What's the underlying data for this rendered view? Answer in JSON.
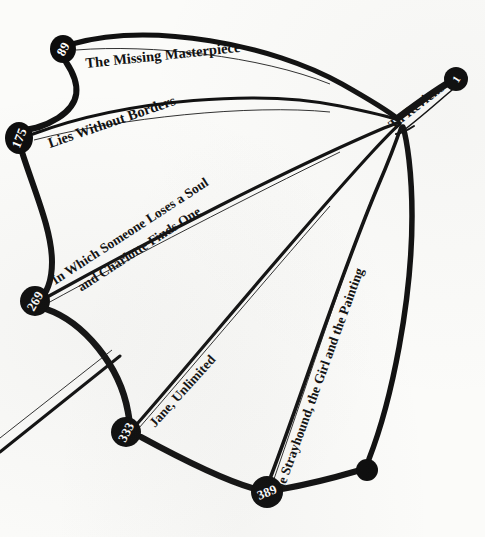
{
  "figure": {
    "type": "node-link-diagram",
    "medium": "printed-book-page-scan",
    "background_color": "#fbfbf9",
    "ink_color": "#111111",
    "node_fill_color": "#0d0d0d",
    "node_text_color": "#ffffff"
  },
  "nodes": [
    {
      "id": "n89",
      "label": "89",
      "x": 63,
      "y": 49,
      "rx": 13,
      "ry": 14,
      "rotation": -62,
      "kind": "numbered-page-node"
    },
    {
      "id": "n175",
      "label": "175",
      "x": 19,
      "y": 138,
      "rx": 14,
      "ry": 16,
      "rotation": -68,
      "kind": "numbered-page-node"
    },
    {
      "id": "n269",
      "label": "269",
      "x": 35,
      "y": 301,
      "rx": 15,
      "ry": 15,
      "rotation": -60,
      "kind": "numbered-page-node"
    },
    {
      "id": "n333",
      "label": "333",
      "x": 126,
      "y": 432,
      "rx": 15,
      "ry": 15,
      "rotation": -62,
      "kind": "numbered-page-node"
    },
    {
      "id": "n389",
      "label": "389",
      "x": 267,
      "y": 492,
      "rx": 16,
      "ry": 16,
      "rotation": -22,
      "kind": "numbered-page-node"
    },
    {
      "id": "n1",
      "label": "1",
      "x": 456,
      "y": 79,
      "rx": 12,
      "ry": 12,
      "rotation": -58,
      "kind": "numbered-page-node"
    },
    {
      "id": "ndot",
      "label": "",
      "x": 367,
      "y": 470,
      "rx": 11,
      "ry": 11,
      "rotation": 0,
      "kind": "plain-node"
    }
  ],
  "hub": {
    "id": "hub",
    "x": 401,
    "y": 122,
    "label": "Tu Reviens"
  },
  "edges": [
    {
      "id": "e1",
      "from": "n89",
      "to": "hub",
      "label": "The Missing Masterpiece"
    },
    {
      "id": "e2",
      "from": "n175",
      "to": "hub",
      "label": "Lies Without Borders"
    },
    {
      "id": "e3",
      "from": "n269",
      "to": "hub",
      "label": "In Which Someone Loses a Soul and Charlotte Finds One"
    },
    {
      "id": "e4",
      "from": "n333",
      "to": "hub",
      "label": "Jane, Unlimited"
    },
    {
      "id": "e5",
      "from": "n389",
      "to": "hub",
      "label": "The Strayhound, the Girl and the Painting"
    },
    {
      "id": "e6",
      "from": "hub",
      "to": "n1",
      "label": "Tu Reviens"
    },
    {
      "id": "e7",
      "from": "n89",
      "to": "n175",
      "label": ""
    },
    {
      "id": "e8",
      "from": "n175",
      "to": "n269",
      "label": ""
    },
    {
      "id": "e9",
      "from": "n269",
      "to": "n333",
      "label": ""
    },
    {
      "id": "e10",
      "from": "n333",
      "to": "n389",
      "label": ""
    },
    {
      "id": "e11",
      "from": "n389",
      "to": "ndot",
      "label": ""
    },
    {
      "id": "e12",
      "from": "ndot",
      "to": "hub",
      "label": ""
    }
  ],
  "labels": {
    "missing_masterpiece": "The Missing Masterpiece",
    "lies_without_borders": "Lies Without Borders",
    "someone_loses_line1": "In Which Someone Loses a Soul",
    "someone_loses_line2": "and Charlotte Finds One",
    "jane_unlimited": "Jane, Unlimited",
    "strayhound": "The Strayhound, the Girl and the Painting",
    "tu_reviens": "Tu Reviens"
  },
  "node_numbers": {
    "n89": "89",
    "n175": "175",
    "n269": "269",
    "n333": "333",
    "n389": "389",
    "n1": "1"
  }
}
